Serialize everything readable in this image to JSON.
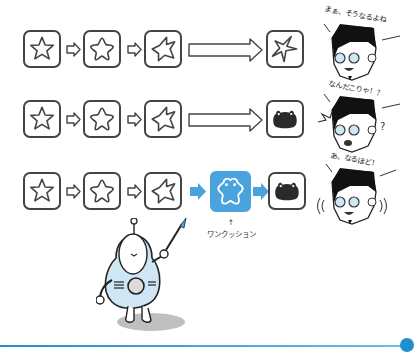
{
  "diagram": {
    "rows": [
      {
        "id": "row-1",
        "steps": [
          "star",
          "rounded-star",
          "warped-star"
        ],
        "transition": "long-outline-arrow",
        "result": "sharp-star",
        "reaction": {
          "speech": "まぁ、そうなるよね",
          "mood": "calm"
        }
      },
      {
        "id": "row-2",
        "steps": [
          "star",
          "rounded-star",
          "warped-star"
        ],
        "transition": "long-outline-arrow",
        "result": "black-frog-blob",
        "reaction": {
          "speech": "なんだこりゃ！？",
          "mood": "confused"
        }
      },
      {
        "id": "row-3",
        "steps": [
          "star",
          "rounded-star",
          "warped-star"
        ],
        "transition": "blue-arrow",
        "intermediate": {
          "shape": "frog-star-outline",
          "caption_arrow": "↑",
          "caption": "ワンクッション"
        },
        "result": "black-frog-blob",
        "reaction": {
          "speech": "あ、なるほど！",
          "mood": "understanding"
        }
      }
    ],
    "character": "robot-with-pointer",
    "colors": {
      "outline": "#444444",
      "accent_blue": "#4aa3dc",
      "robot_body": "#cfe6f5",
      "line_blue": "#1f8fd0"
    }
  }
}
